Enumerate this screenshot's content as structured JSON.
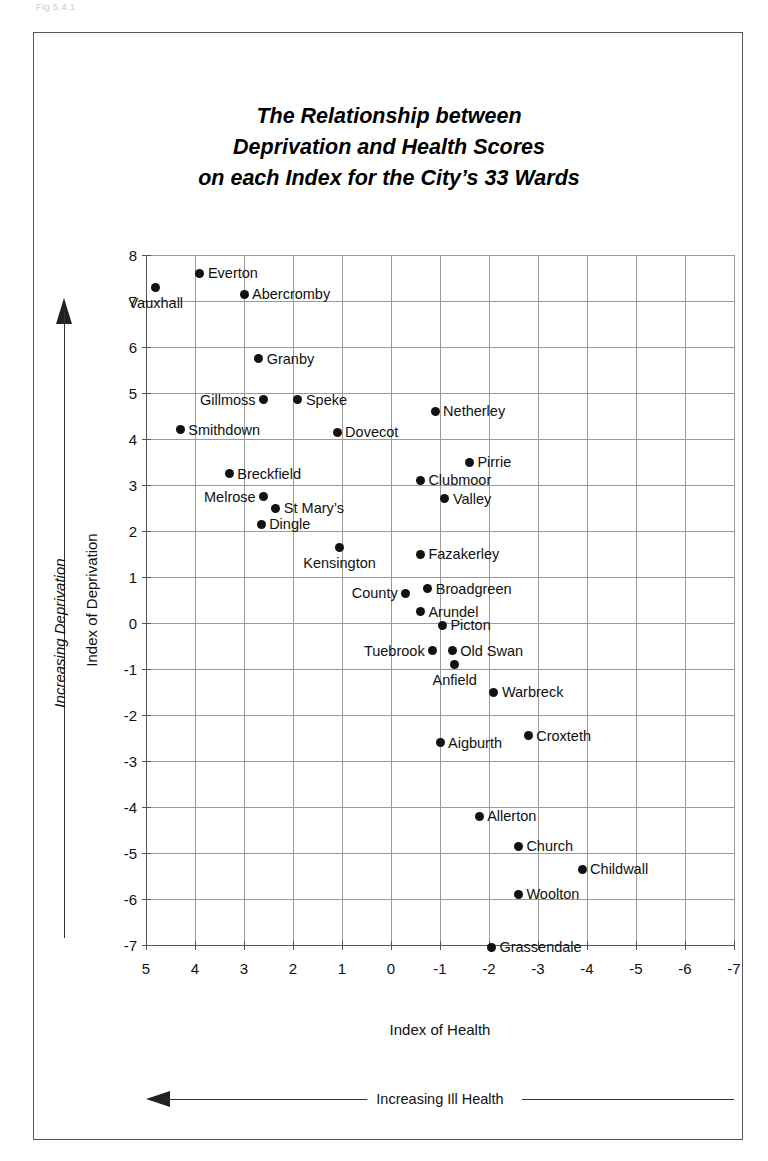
{
  "figure": {
    "caption_artifact": "Fig 5.4.1",
    "title_lines": [
      "The Relationship between",
      "Deprivation and Health Scores",
      "on each Index for the City’s 33 Wards"
    ]
  },
  "axes": {
    "x_title": "Index of Health",
    "y_title": "Index of Deprivation",
    "x_ticks": [
      "5",
      "4",
      "3",
      "2",
      "1",
      "0",
      "-1",
      "-2",
      "-3",
      "-4",
      "-5",
      "-6",
      "-7"
    ],
    "y_ticks": [
      "8",
      "7",
      "6",
      "5",
      "4",
      "3",
      "2",
      "1",
      "0",
      "-1",
      "-2",
      "-3",
      "-4",
      "-5",
      "-6",
      "-7"
    ]
  },
  "annotations": {
    "y_arrow_label": "Increasing Deprivation",
    "x_arrow_label": "Increasing Ill Health"
  },
  "chart_data": {
    "type": "scatter",
    "title": "The Relationship between Deprivation and Health Scores on each Index for the City’s 33 Wards",
    "xlabel": "Index of Health",
    "ylabel": "Index of Deprivation",
    "xlim": [
      5,
      -7
    ],
    "ylim": [
      -7,
      8
    ],
    "x_reversed": true,
    "grid": true,
    "legend": "none",
    "n_points": 33,
    "points": [
      {
        "name": "Vauxhall",
        "x": 4.8,
        "y": 7.3,
        "label_pos": "below"
      },
      {
        "name": "Everton",
        "x": 3.9,
        "y": 7.6,
        "label_pos": "right"
      },
      {
        "name": "Abercromby",
        "x": 3.0,
        "y": 7.15,
        "label_pos": "right"
      },
      {
        "name": "Granby",
        "x": 2.7,
        "y": 5.75,
        "label_pos": "right"
      },
      {
        "name": "Gillmoss",
        "x": 2.6,
        "y": 4.85,
        "label_pos": "left"
      },
      {
        "name": "Speke",
        "x": 1.9,
        "y": 4.85,
        "label_pos": "right"
      },
      {
        "name": "Netherley",
        "x": -0.9,
        "y": 4.6,
        "label_pos": "right"
      },
      {
        "name": "Smithdown",
        "x": 4.3,
        "y": 4.2,
        "label_pos": "right"
      },
      {
        "name": "Dovecot",
        "x": 1.1,
        "y": 4.15,
        "label_pos": "right"
      },
      {
        "name": "Pirrie",
        "x": -1.6,
        "y": 3.5,
        "label_pos": "right"
      },
      {
        "name": "Breckfield",
        "x": 3.3,
        "y": 3.25,
        "label_pos": "right"
      },
      {
        "name": "Clubmoor",
        "x": -0.6,
        "y": 3.1,
        "label_pos": "right"
      },
      {
        "name": "Melrose",
        "x": 2.6,
        "y": 2.75,
        "label_pos": "left"
      },
      {
        "name": "Valley",
        "x": -1.1,
        "y": 2.7,
        "label_pos": "right"
      },
      {
        "name": "St Mary’s",
        "x": 2.35,
        "y": 2.5,
        "label_pos": "right"
      },
      {
        "name": "Dingle",
        "x": 2.65,
        "y": 2.15,
        "label_pos": "right"
      },
      {
        "name": "Kensington",
        "x": 1.05,
        "y": 1.65,
        "label_pos": "below"
      },
      {
        "name": "Fazakerley",
        "x": -0.6,
        "y": 1.5,
        "label_pos": "right"
      },
      {
        "name": "County",
        "x": -0.3,
        "y": 0.65,
        "label_pos": "left"
      },
      {
        "name": "Broadgreen",
        "x": -0.75,
        "y": 0.75,
        "label_pos": "right"
      },
      {
        "name": "Arundel",
        "x": -0.6,
        "y": 0.25,
        "label_pos": "right"
      },
      {
        "name": "Picton",
        "x": -1.05,
        "y": -0.05,
        "label_pos": "right"
      },
      {
        "name": "Tuebrook",
        "x": -0.85,
        "y": -0.6,
        "label_pos": "left"
      },
      {
        "name": "Old Swan",
        "x": -1.25,
        "y": -0.6,
        "label_pos": "right"
      },
      {
        "name": "Anfield",
        "x": -1.3,
        "y": -0.9,
        "label_pos": "below"
      },
      {
        "name": "Warbreck",
        "x": -2.1,
        "y": -1.5,
        "label_pos": "right"
      },
      {
        "name": "Aigburth",
        "x": -1.0,
        "y": -2.6,
        "label_pos": "right"
      },
      {
        "name": "Croxteth",
        "x": -2.8,
        "y": -2.45,
        "label_pos": "right"
      },
      {
        "name": "Allerton",
        "x": -1.8,
        "y": -4.2,
        "label_pos": "right"
      },
      {
        "name": "Church",
        "x": -2.6,
        "y": -4.85,
        "label_pos": "right"
      },
      {
        "name": "Childwall",
        "x": -3.9,
        "y": -5.35,
        "label_pos": "right"
      },
      {
        "name": "Woolton",
        "x": -2.6,
        "y": -5.9,
        "label_pos": "right"
      },
      {
        "name": "Grassendale",
        "x": -2.05,
        "y": -7.05,
        "label_pos": "right"
      }
    ]
  }
}
